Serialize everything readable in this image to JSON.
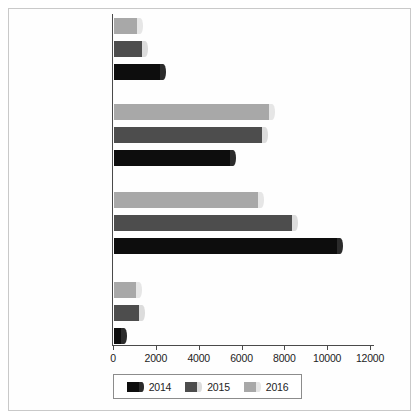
{
  "chart_data": {
    "type": "bar",
    "orientation": "horizontal",
    "title": "",
    "xlabel": "",
    "ylabel": "",
    "categories": [
      "Research\nQuestions,\nIn person",
      "FAQ Views",
      "Total In person\nTransactions",
      "Total Chats"
    ],
    "series": [
      {
        "name": "2014",
        "color": "#0d0d0d",
        "values": [
          2450,
          5700,
          10700,
          600
        ]
      },
      {
        "name": "2015",
        "color": "#4d4d4d",
        "values": [
          1600,
          7200,
          8600,
          1450
        ]
      },
      {
        "name": "2016",
        "color": "#a8a8a8",
        "values": [
          1350,
          7500,
          7000,
          1300
        ]
      }
    ],
    "xlim": [
      0,
      12000
    ],
    "xticks": [
      0,
      2000,
      4000,
      6000,
      8000,
      10000,
      12000
    ],
    "xtick_labels": [
      "0",
      "2000",
      "4000",
      "6000",
      "8000",
      "10000",
      "12000"
    ],
    "grid": false,
    "legend_position": "bottom",
    "series_draw_order_top_to_bottom": [
      "2016",
      "2015",
      "2014"
    ]
  },
  "legend": {
    "entries": [
      {
        "label": "2014",
        "color": "#0d0d0d"
      },
      {
        "label": "2015",
        "color": "#4d4d4d"
      },
      {
        "label": "2016",
        "color": "#a8a8a8"
      }
    ]
  }
}
